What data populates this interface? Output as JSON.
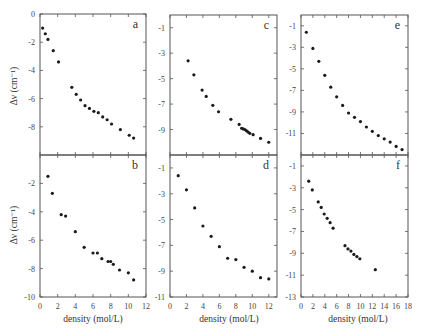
{
  "figure": {
    "ylabel": "Δν (cm⁻¹)",
    "xlabel": "density (mol/L)",
    "marker_color": "#1a1a1a",
    "frame_color": "#555555"
  },
  "chart_data": [
    {
      "panel": "a",
      "type": "scatter",
      "xlabel": "",
      "ylabel": "Δν (cm⁻¹)",
      "xlim": [
        0,
        12
      ],
      "ylim": [
        -10,
        0
      ],
      "xticks": [
        0,
        2,
        4,
        6,
        8,
        10,
        12
      ],
      "yticks": [
        0,
        -2,
        -4,
        -6,
        -8
      ],
      "ytick_labels": [
        "0",
        "-2",
        "-4",
        "-6",
        "-8"
      ],
      "x": [
        0.3,
        0.6,
        0.9,
        1.5,
        2.1,
        3.6,
        4.1,
        4.6,
        5.1,
        5.6,
        6.1,
        6.6,
        7.1,
        7.6,
        8.1,
        9.1,
        10.1,
        10.6
      ],
      "y": [
        -1.0,
        -1.4,
        -1.8,
        -2.6,
        -3.4,
        -5.2,
        -5.7,
        -6.1,
        -6.5,
        -6.7,
        -6.9,
        -7.0,
        -7.3,
        -7.5,
        -7.8,
        -8.2,
        -8.6,
        -8.8
      ]
    },
    {
      "panel": "b",
      "type": "scatter",
      "xlabel": "density (mol/L)",
      "ylabel": "Δν (cm⁻¹)",
      "xlim": [
        0,
        12
      ],
      "ylim": [
        -10,
        0
      ],
      "xticks": [
        0,
        2,
        4,
        6,
        8,
        10,
        12
      ],
      "xtick_labels": [
        "0",
        "2",
        "4",
        "6",
        "8",
        "10",
        "12"
      ],
      "yticks": [
        -2,
        -4,
        -6,
        -8,
        -10
      ],
      "ytick_labels": [
        "-2",
        "-4",
        "-6",
        "-8",
        "-10"
      ],
      "x": [
        0.9,
        1.4,
        2.4,
        2.9,
        4.0,
        5.0,
        6.0,
        6.5,
        7.0,
        7.7,
        8.0,
        8.3,
        9.0,
        10.0,
        10.6
      ],
      "y": [
        -1.5,
        -2.7,
        -4.2,
        -4.3,
        -5.4,
        -6.5,
        -6.9,
        -6.9,
        -7.3,
        -7.5,
        -7.5,
        -7.7,
        -8.1,
        -8.3,
        -8.8
      ]
    },
    {
      "panel": "c",
      "type": "scatter",
      "xlabel": "",
      "ylabel": "",
      "xlim": [
        0,
        13
      ],
      "ylim": [
        -11,
        0
      ],
      "xticks": [
        0,
        2,
        4,
        6,
        8,
        10,
        12
      ],
      "yticks": [
        -1,
        -3,
        -5,
        -7,
        -9
      ],
      "ytick_labels": [
        "-1",
        "-3",
        "-5",
        "-7",
        "-9"
      ],
      "x": [
        2.2,
        2.9,
        3.9,
        4.4,
        5.2,
        5.9,
        7.4,
        8.4,
        8.7,
        8.9,
        9.1,
        9.3,
        9.5,
        9.7,
        10.1,
        11.0,
        12.0
      ],
      "y": [
        -3.6,
        -4.7,
        -5.9,
        -6.4,
        -7.1,
        -7.6,
        -8.2,
        -8.6,
        -8.9,
        -8.95,
        -9.0,
        -9.1,
        -9.2,
        -9.3,
        -9.4,
        -9.7,
        -10.0
      ]
    },
    {
      "panel": "d",
      "type": "scatter",
      "xlabel": "density (mol/L)",
      "ylabel": "",
      "xlim": [
        0,
        13
      ],
      "ylim": [
        -11,
        0
      ],
      "xticks": [
        0,
        2,
        4,
        6,
        8,
        10,
        12
      ],
      "xtick_labels": [
        "0",
        "2",
        "4",
        "6",
        "8",
        "10",
        "12"
      ],
      "yticks": [
        -1,
        -3,
        -5,
        -7,
        -9,
        -11
      ],
      "ytick_labels": [
        "-1",
        "-3",
        "-5",
        "-7",
        "-9",
        "-11"
      ],
      "x": [
        1.0,
        2.0,
        3.0,
        4.0,
        5.0,
        6.0,
        7.0,
        8.0,
        9.0,
        10.0,
        11.0,
        12.0
      ],
      "y": [
        -1.6,
        -2.7,
        -4.1,
        -5.5,
        -6.3,
        -7.1,
        -8.0,
        -8.1,
        -8.7,
        -9.0,
        -9.5,
        -9.6
      ]
    },
    {
      "panel": "e",
      "type": "scatter",
      "xlabel": "",
      "ylabel": "",
      "xlim": [
        0,
        18
      ],
      "ylim": [
        -13,
        0
      ],
      "xticks": [
        0,
        2,
        4,
        6,
        8,
        10,
        12,
        14,
        16,
        18
      ],
      "yticks": [
        -1,
        -3,
        -5,
        -7,
        -9,
        -11
      ],
      "ytick_labels": [
        "-1",
        "-3",
        "-5",
        "-7",
        "-9",
        "-11"
      ],
      "x": [
        0.9,
        2.0,
        3.0,
        4.0,
        5.0,
        6.0,
        7.0,
        8.0,
        9.0,
        10.0,
        11.0,
        12.0,
        13.0,
        14.0,
        15.0,
        16.0,
        17.0
      ],
      "y": [
        -1.6,
        -3.1,
        -4.3,
        -5.6,
        -6.7,
        -7.6,
        -8.4,
        -9.1,
        -9.5,
        -9.9,
        -10.4,
        -10.8,
        -11.2,
        -11.5,
        -11.8,
        -12.2,
        -12.5
      ]
    },
    {
      "panel": "f",
      "type": "scatter",
      "xlabel": "density (mol/L)",
      "ylabel": "",
      "xlim": [
        0,
        18
      ],
      "ylim": [
        -13,
        0
      ],
      "xticks": [
        0,
        2,
        4,
        6,
        8,
        10,
        12,
        14,
        16,
        18
      ],
      "xtick_labels": [
        "0",
        "2",
        "4",
        "6",
        "8",
        "10",
        "12",
        "14",
        "16",
        "18"
      ],
      "yticks": [
        -1,
        -3,
        -5,
        -7,
        -9,
        -11,
        -13
      ],
      "ytick_labels": [
        "-1",
        "-3",
        "-5",
        "-7",
        "-9",
        "-11",
        "-13"
      ],
      "x": [
        1.3,
        1.9,
        2.9,
        3.4,
        3.9,
        4.4,
        4.9,
        5.4,
        7.4,
        7.9,
        8.4,
        8.9,
        9.4,
        9.9,
        12.5
      ],
      "y": [
        -2.4,
        -3.2,
        -4.3,
        -4.8,
        -5.4,
        -5.8,
        -6.2,
        -6.7,
        -8.3,
        -8.6,
        -8.8,
        -9.1,
        -9.3,
        -9.5,
        -10.5
      ]
    }
  ]
}
